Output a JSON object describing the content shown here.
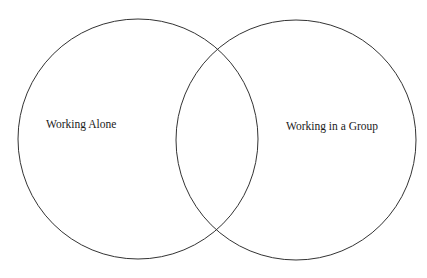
{
  "diagram": {
    "type": "venn",
    "sets": [
      {
        "id": "alone",
        "label": "Working Alone"
      },
      {
        "id": "group",
        "label": "Working in a Group"
      }
    ],
    "intersection_label": "",
    "colors": {
      "stroke": "#333333",
      "text": "#1a1a1a",
      "background": "#ffffff"
    }
  }
}
